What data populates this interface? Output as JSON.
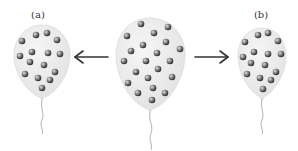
{
  "figure": {
    "labels": {
      "a": "(a)",
      "b": "(b)"
    },
    "colors": {
      "balloon_fill": "#ececec",
      "balloon_edge": "#dcdcdc",
      "sphere_dark": "#3a3a3a",
      "sphere_light": "#d8d8d8",
      "arrow": "#333333",
      "string": "#9a9a9a"
    },
    "balloons": [
      {
        "id": "a",
        "label": "(a)",
        "sphere_count": 15
      },
      {
        "id": "middle",
        "label": "",
        "sphere_count": 21
      },
      {
        "id": "b",
        "label": "(b)",
        "sphere_count": 15
      }
    ],
    "arrows": [
      {
        "direction": "left",
        "from": "middle",
        "to": "a"
      },
      {
        "direction": "right",
        "from": "middle",
        "to": "b"
      }
    ]
  }
}
